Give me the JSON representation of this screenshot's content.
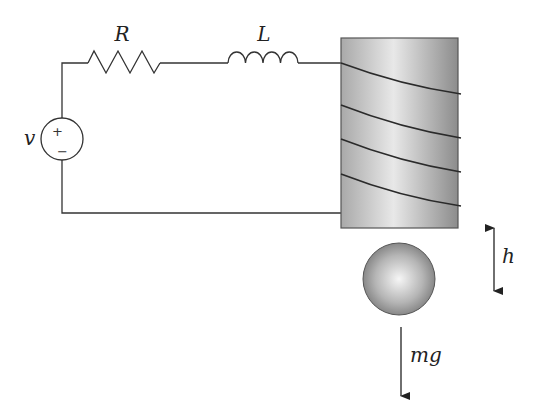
{
  "diagram": {
    "labels": {
      "resistor": "R",
      "inductor": "L",
      "source": "v",
      "source_plus": "+",
      "source_minus": "−",
      "height": "h",
      "gravity": "mg"
    },
    "components": [
      {
        "id": "voltage-source",
        "label": "v"
      },
      {
        "id": "resistor",
        "label": "R"
      },
      {
        "id": "inductor",
        "label": "L"
      },
      {
        "id": "electromagnet-coil",
        "turns": 4
      },
      {
        "id": "steel-ball"
      },
      {
        "id": "height-arrow",
        "label": "h"
      },
      {
        "id": "gravity-arrow",
        "label": "mg"
      }
    ],
    "colors": {
      "wire": "#333333",
      "core_light": "#e6e6e6",
      "core_dark": "#8a8a8a",
      "ball_light": "#f2f2f2",
      "ball_dark": "#777777"
    }
  }
}
